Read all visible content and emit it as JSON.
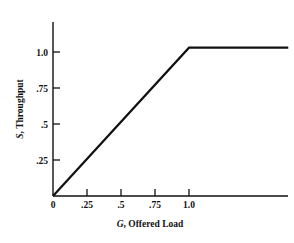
{
  "chart_data": {
    "type": "line",
    "title": "",
    "xlabel": "G, Offered Load",
    "ylabel": "S, Throughput",
    "xlabel_symbol": "G",
    "xlabel_rest": ", Offered Load",
    "ylabel_symbol": "S",
    "ylabel_rest": ", Throughput",
    "xlim": [
      0,
      1.73
    ],
    "ylim": [
      0,
      1.18
    ],
    "grid": false,
    "legend": false,
    "xticks": [
      0,
      0.25,
      0.5,
      0.75,
      1.0
    ],
    "xticklabels": [
      "0",
      ".25",
      ".5",
      ".75",
      "1.0"
    ],
    "yticks": [
      0.25,
      0.5,
      0.75,
      1.0
    ],
    "yticklabels": [
      ".25",
      ".5",
      ".75",
      "1.0"
    ],
    "series": [
      {
        "name": "ideal throughput",
        "x": [
          0,
          1.0,
          1.73
        ],
        "y": [
          0,
          1.03,
          1.03
        ]
      }
    ]
  },
  "axes": {
    "x_axis_name": "x-axis",
    "y_axis_name": "y-axis"
  }
}
